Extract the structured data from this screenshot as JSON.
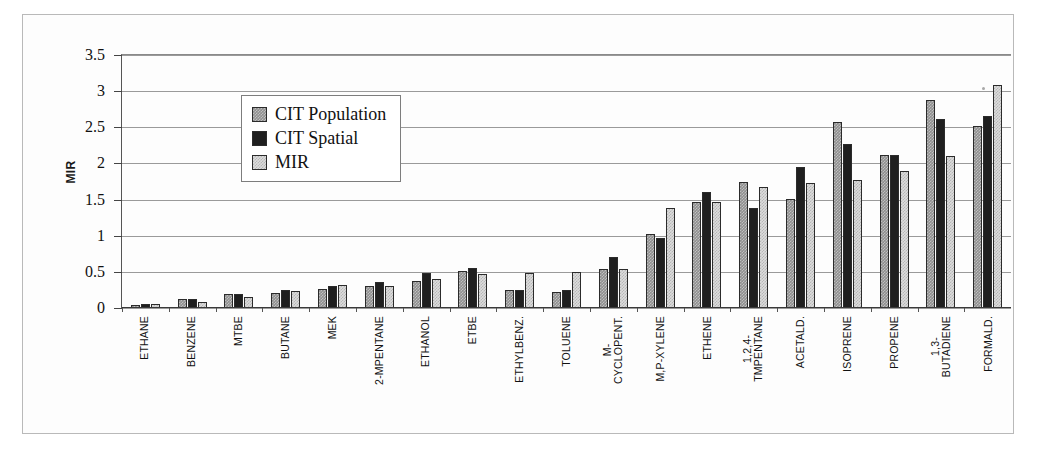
{
  "figure": {
    "ylabel": "MIR",
    "legend": {
      "position": "upper-left-inside",
      "items": [
        {
          "label": "CIT Population",
          "swatch": "medium-gray-pattern",
          "color": "#8f8f8f"
        },
        {
          "label": "CIT Spatial",
          "swatch": "solid-dark",
          "color": "#1f1f1f"
        },
        {
          "label": "MIR",
          "swatch": "light-gray-pattern",
          "color": "#dcdcdc"
        }
      ]
    },
    "yticks": [
      "0",
      "0.5",
      "1",
      "1.5",
      "2",
      "2.5",
      "3",
      "3.5"
    ]
  },
  "chart_data": {
    "type": "bar",
    "title": "",
    "xlabel": "",
    "ylabel": "MIR",
    "ylim": [
      0,
      3.5
    ],
    "ytick_step": 0.5,
    "grid": true,
    "legend_position": "upper left (inside axes)",
    "categories": [
      "ETHANE",
      "BENZENE",
      "MTBE",
      "BUTANE",
      "MEK",
      "2-MPENTANE",
      "ETHANOL",
      "ETBE",
      "ETHYLBENZ.",
      "TOLUENE",
      "M-\nCYCLOPENT.",
      "M,P-XYLENE",
      "ETHENE",
      "1,2,4-\nTMPENTANE",
      "ACETALD.",
      "ISOPRENE",
      "PROPENE",
      "1,3-\nBUTADIENE",
      "FORMALD."
    ],
    "series": [
      {
        "name": "CIT Population",
        "color": "#8f8f8f",
        "values": [
          0.04,
          0.13,
          0.19,
          0.21,
          0.26,
          0.31,
          0.38,
          0.51,
          0.25,
          0.22,
          0.54,
          1.03,
          1.47,
          1.74,
          1.51,
          2.58,
          2.11,
          2.88,
          2.52
        ]
      },
      {
        "name": "CIT Spatial",
        "color": "#1f1f1f",
        "values": [
          0.06,
          0.13,
          0.19,
          0.25,
          0.31,
          0.36,
          0.48,
          0.56,
          0.25,
          0.25,
          0.71,
          0.97,
          1.6,
          1.39,
          1.95,
          2.27,
          2.11,
          2.62,
          2.65
        ]
      },
      {
        "name": "MIR",
        "color": "#dcdcdc",
        "values": [
          0.05,
          0.08,
          0.15,
          0.23,
          0.32,
          0.3,
          0.4,
          0.47,
          0.49,
          0.5,
          0.54,
          1.39,
          1.47,
          1.68,
          1.73,
          1.77,
          1.9,
          2.1,
          3.08
        ]
      }
    ]
  }
}
